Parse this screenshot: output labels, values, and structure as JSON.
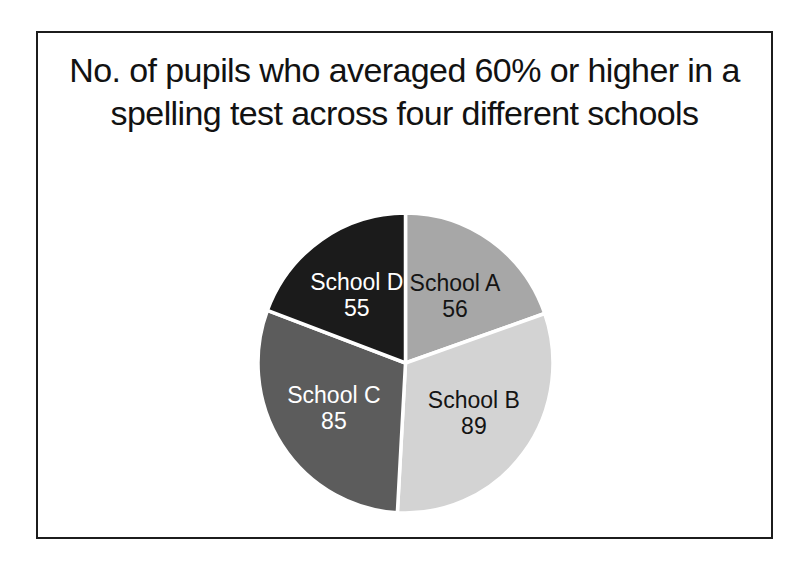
{
  "page": {
    "background_color": "#ffffff"
  },
  "frame": {
    "border_color": "#1c1c1c",
    "background_color": "#ffffff"
  },
  "title": {
    "lines": [
      "No. of pupils who averaged 60% or higher in a",
      "spelling test across four different schools"
    ],
    "color": "#121212"
  },
  "chart_data": {
    "type": "pie",
    "title": "No. of pupils who averaged 60% or higher in a spelling test across four different schools",
    "categories": [
      "School A",
      "School B",
      "School C",
      "School D"
    ],
    "values": [
      56,
      89,
      85,
      55
    ],
    "slice_colors": [
      "#a7a7a7",
      "#d3d3d3",
      "#5c5c5c",
      "#1b1b1b"
    ],
    "label_text_colors": [
      "#141414",
      "#141414",
      "#ffffff",
      "#ffffff"
    ],
    "start_angle_deg": 0,
    "direction": "clockwise",
    "slice_separator_color": "#ffffff",
    "legend_position": "none",
    "data_label_style": "category name and value inside each slice"
  }
}
